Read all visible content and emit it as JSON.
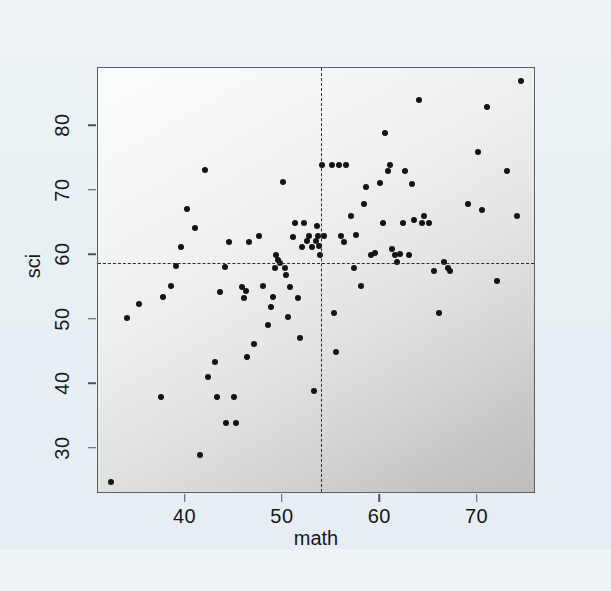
{
  "figure": {
    "background_color": "#eaf1f5",
    "plot_background_note": "gray gradient, light top-left to dark bottom-right",
    "frame_color": "#5a6066",
    "point_color": "#111315",
    "reference_line_color": "#2b2e31"
  },
  "chart_data": {
    "type": "scatter",
    "title": "",
    "xlabel": "math",
    "ylabel": "sci",
    "xlim": [
      31,
      76
    ],
    "ylim": [
      23,
      89
    ],
    "xticks": [
      40,
      50,
      60,
      70
    ],
    "xtick_labels": [
      "40",
      "50",
      "60",
      "70"
    ],
    "yticks": [
      30,
      40,
      50,
      60,
      70,
      80
    ],
    "ytick_labels": [
      "30",
      "40",
      "50",
      "60",
      "70",
      "80"
    ],
    "grid": false,
    "legend": null,
    "annotations": [
      {
        "kind": "vline",
        "value": 53.9,
        "style": "dashed",
        "label": "mean math"
      },
      {
        "kind": "hline",
        "value": 58.8,
        "style": "dashed",
        "label": "mean sci"
      }
    ],
    "x": [
      32.3,
      34.0,
      35.2,
      37.5,
      37.7,
      38.5,
      39.0,
      39.5,
      40.1,
      41.0,
      41.5,
      42.0,
      42.3,
      43.0,
      43.2,
      43.5,
      44.0,
      44.2,
      44.5,
      45.0,
      45.2,
      45.8,
      46.0,
      46.2,
      46.3,
      46.5,
      47.0,
      47.5,
      48.0,
      48.5,
      48.8,
      49.0,
      49.2,
      49.3,
      49.5,
      49.7,
      50.0,
      50.2,
      50.3,
      50.5,
      50.7,
      51.0,
      51.2,
      51.5,
      51.8,
      52.0,
      52.2,
      52.5,
      52.7,
      53.0,
      53.2,
      53.4,
      53.5,
      53.6,
      53.7,
      53.8,
      54.0,
      54.2,
      55.0,
      55.2,
      55.5,
      55.8,
      56.0,
      56.3,
      56.5,
      57.0,
      57.3,
      57.5,
      58.0,
      58.3,
      58.5,
      59.0,
      59.5,
      60.0,
      60.3,
      60.5,
      60.8,
      61.0,
      61.2,
      61.5,
      61.7,
      62.0,
      62.3,
      62.5,
      63.0,
      63.3,
      63.5,
      64.0,
      64.3,
      64.5,
      65.0,
      65.5,
      66.0,
      66.5,
      67.0,
      67.2,
      69.0,
      70.0,
      70.5,
      71.0,
      72.0,
      73.0,
      74.0,
      74.5
    ],
    "y": [
      24.8,
      50.3,
      52.4,
      38.0,
      53.5,
      55.2,
      58.3,
      61.2,
      67.1,
      64.2,
      29.0,
      73.2,
      41.2,
      43.5,
      38.0,
      54.3,
      58.2,
      34.0,
      62.0,
      38.0,
      34.0,
      55.0,
      53.3,
      54.5,
      44.2,
      62.0,
      46.3,
      63.0,
      55.2,
      49.2,
      52.0,
      53.5,
      58.0,
      60.0,
      59.3,
      58.8,
      71.3,
      58.0,
      57.0,
      50.5,
      55.0,
      62.8,
      65.0,
      53.3,
      47.2,
      61.2,
      65.0,
      62.2,
      63.0,
      61.2,
      39.0,
      62.2,
      64.5,
      63.0,
      61.5,
      60.0,
      74.0,
      63.0,
      74.0,
      51.0,
      45.0,
      74.0,
      63.0,
      62.0,
      74.0,
      66.0,
      58.0,
      63.2,
      55.2,
      68.0,
      70.5,
      60.0,
      60.3,
      71.2,
      65.0,
      79.0,
      73.0,
      74.0,
      61.0,
      60.0,
      59.0,
      60.2,
      65.0,
      73.0,
      60.0,
      71.0,
      65.5,
      84.0,
      65.0,
      66.0,
      65.0,
      57.5,
      51.0,
      59.0,
      58.0,
      57.5,
      68.0,
      76.0,
      67.0,
      83.0,
      56.0,
      73.0,
      66.0,
      87.0
    ]
  }
}
